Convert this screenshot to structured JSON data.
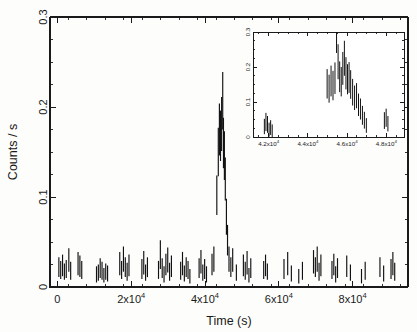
{
  "figure": {
    "kind": "x-ray-light-curve",
    "background_color": "#fdfdfc",
    "ink_color": "#111111"
  },
  "chart_data": {
    "type": "line",
    "title": "",
    "subtitle": "",
    "xlabel": "Time (s)",
    "ylabel": "Counts / s",
    "xlim": [
      -2000,
      95000
    ],
    "ylim": [
      0,
      0.3
    ],
    "grid": false,
    "legend": null,
    "legend_position": "none",
    "x_ticks": [
      0,
      20000,
      40000,
      60000,
      80000
    ],
    "x_tick_labels": [
      "0",
      "2x10",
      "4x10",
      "6x10",
      "8x10"
    ],
    "x_tick_exponents": [
      "",
      "4",
      "4",
      "4",
      "4"
    ],
    "x_minor_tick_step": 5000,
    "y_ticks": [
      0,
      0.1,
      0.2,
      0.3
    ],
    "y_tick_labels": [
      "0",
      "0.1",
      "0.2",
      "0.3"
    ],
    "y_minor_tick_step": 0.025,
    "series": [
      {
        "name": "0.2-10 keV count rate",
        "style": "errorbar-vertical",
        "points": [
          {
            "x": 400,
            "y": 0.022,
            "yerr": 0.011
          },
          {
            "x": 900,
            "y": 0.019,
            "yerr": 0.01
          },
          {
            "x": 1400,
            "y": 0.024,
            "yerr": 0.012
          },
          {
            "x": 1900,
            "y": 0.017,
            "yerr": 0.009
          },
          {
            "x": 2400,
            "y": 0.02,
            "yerr": 0.01
          },
          {
            "x": 3100,
            "y": 0.03,
            "yerr": 0.013
          },
          {
            "x": 3600,
            "y": 0.018,
            "yerr": 0.01
          },
          {
            "x": 5600,
            "y": 0.026,
            "yerr": 0.013
          },
          {
            "x": 6100,
            "y": 0.023,
            "yerr": 0.012
          },
          {
            "x": 6600,
            "y": 0.019,
            "yerr": 0.01
          },
          {
            "x": 10600,
            "y": 0.014,
            "yerr": 0.009
          },
          {
            "x": 11100,
            "y": 0.016,
            "yerr": 0.009
          },
          {
            "x": 11600,
            "y": 0.021,
            "yerr": 0.011
          },
          {
            "x": 12100,
            "y": 0.018,
            "yerr": 0.01
          },
          {
            "x": 12600,
            "y": 0.013,
            "yerr": 0.008
          },
          {
            "x": 13100,
            "y": 0.017,
            "yerr": 0.009
          },
          {
            "x": 13600,
            "y": 0.015,
            "yerr": 0.009
          },
          {
            "x": 16900,
            "y": 0.026,
            "yerr": 0.013
          },
          {
            "x": 17400,
            "y": 0.019,
            "yerr": 0.01
          },
          {
            "x": 17900,
            "y": 0.031,
            "yerr": 0.014
          },
          {
            "x": 18400,
            "y": 0.022,
            "yerr": 0.011
          },
          {
            "x": 18900,
            "y": 0.017,
            "yerr": 0.01
          },
          {
            "x": 19400,
            "y": 0.024,
            "yerr": 0.012
          },
          {
            "x": 22900,
            "y": 0.02,
            "yerr": 0.011
          },
          {
            "x": 23400,
            "y": 0.027,
            "yerr": 0.013
          },
          {
            "x": 23900,
            "y": 0.016,
            "yerr": 0.009
          },
          {
            "x": 24400,
            "y": 0.022,
            "yerr": 0.011
          },
          {
            "x": 27400,
            "y": 0.019,
            "yerr": 0.01
          },
          {
            "x": 27900,
            "y": 0.036,
            "yerr": 0.016
          },
          {
            "x": 28400,
            "y": 0.021,
            "yerr": 0.011
          },
          {
            "x": 28900,
            "y": 0.014,
            "yerr": 0.009
          },
          {
            "x": 29400,
            "y": 0.025,
            "yerr": 0.012
          },
          {
            "x": 29900,
            "y": 0.03,
            "yerr": 0.014
          },
          {
            "x": 30400,
            "y": 0.017,
            "yerr": 0.01
          },
          {
            "x": 30900,
            "y": 0.023,
            "yerr": 0.012
          },
          {
            "x": 33400,
            "y": 0.018,
            "yerr": 0.01
          },
          {
            "x": 33900,
            "y": 0.026,
            "yerr": 0.013
          },
          {
            "x": 34400,
            "y": 0.015,
            "yerr": 0.009
          },
          {
            "x": 34900,
            "y": 0.022,
            "yerr": 0.011
          },
          {
            "x": 35400,
            "y": 0.019,
            "yerr": 0.01
          },
          {
            "x": 35900,
            "y": 0.012,
            "yerr": 0.008
          },
          {
            "x": 38400,
            "y": 0.021,
            "yerr": 0.011
          },
          {
            "x": 38900,
            "y": 0.028,
            "yerr": 0.013
          },
          {
            "x": 39400,
            "y": 0.016,
            "yerr": 0.009
          },
          {
            "x": 39900,
            "y": 0.02,
            "yerr": 0.011
          },
          {
            "x": 40400,
            "y": 0.014,
            "yerr": 0.009
          },
          {
            "x": 41900,
            "y": 0.025,
            "yerr": 0.012
          },
          {
            "x": 42400,
            "y": 0.031,
            "yerr": 0.014
          },
          {
            "x": 43200,
            "y": 0.102,
            "yerr": 0.022
          },
          {
            "x": 43600,
            "y": 0.15,
            "yerr": 0.027
          },
          {
            "x": 43900,
            "y": 0.175,
            "yerr": 0.029
          },
          {
            "x": 44200,
            "y": 0.168,
            "yerr": 0.028
          },
          {
            "x": 44500,
            "y": 0.181,
            "yerr": 0.03
          },
          {
            "x": 44800,
            "y": 0.207,
            "yerr": 0.032
          },
          {
            "x": 45000,
            "y": 0.16,
            "yerr": 0.028
          },
          {
            "x": 45250,
            "y": 0.146,
            "yerr": 0.027
          },
          {
            "x": 45500,
            "y": 0.12,
            "yerr": 0.024
          },
          {
            "x": 45800,
            "y": 0.078,
            "yerr": 0.02
          },
          {
            "x": 46100,
            "y": 0.052,
            "yerr": 0.017
          },
          {
            "x": 46500,
            "y": 0.031,
            "yerr": 0.014
          },
          {
            "x": 47000,
            "y": 0.022,
            "yerr": 0.011
          },
          {
            "x": 47500,
            "y": 0.03,
            "yerr": 0.013
          },
          {
            "x": 48500,
            "y": 0.016,
            "yerr": 0.009
          },
          {
            "x": 50400,
            "y": 0.024,
            "yerr": 0.012
          },
          {
            "x": 50900,
            "y": 0.018,
            "yerr": 0.01
          },
          {
            "x": 51400,
            "y": 0.027,
            "yerr": 0.013
          },
          {
            "x": 51900,
            "y": 0.013,
            "yerr": 0.008
          },
          {
            "x": 52400,
            "y": 0.021,
            "yerr": 0.011
          },
          {
            "x": 55900,
            "y": 0.019,
            "yerr": 0.01
          },
          {
            "x": 56400,
            "y": 0.024,
            "yerr": 0.012
          },
          {
            "x": 56900,
            "y": 0.017,
            "yerr": 0.009
          },
          {
            "x": 61400,
            "y": 0.02,
            "yerr": 0.011
          },
          {
            "x": 62400,
            "y": 0.026,
            "yerr": 0.013
          },
          {
            "x": 63400,
            "y": 0.015,
            "yerr": 0.009
          },
          {
            "x": 65400,
            "y": 0.012,
            "yerr": 0.008
          },
          {
            "x": 66400,
            "y": 0.018,
            "yerr": 0.01
          },
          {
            "x": 69400,
            "y": 0.028,
            "yerr": 0.013
          },
          {
            "x": 69900,
            "y": 0.022,
            "yerr": 0.011
          },
          {
            "x": 70400,
            "y": 0.031,
            "yerr": 0.014
          },
          {
            "x": 70900,
            "y": 0.017,
            "yerr": 0.01
          },
          {
            "x": 71400,
            "y": 0.024,
            "yerr": 0.012
          },
          {
            "x": 74400,
            "y": 0.019,
            "yerr": 0.01
          },
          {
            "x": 74900,
            "y": 0.025,
            "yerr": 0.012
          },
          {
            "x": 75400,
            "y": 0.014,
            "yerr": 0.009
          },
          {
            "x": 75900,
            "y": 0.021,
            "yerr": 0.011
          },
          {
            "x": 78400,
            "y": 0.023,
            "yerr": 0.012
          },
          {
            "x": 79400,
            "y": 0.016,
            "yerr": 0.009
          },
          {
            "x": 82400,
            "y": 0.012,
            "yerr": 0.008
          },
          {
            "x": 83400,
            "y": 0.018,
            "yerr": 0.01
          },
          {
            "x": 87400,
            "y": 0.022,
            "yerr": 0.011
          },
          {
            "x": 88400,
            "y": 0.015,
            "yerr": 0.009
          },
          {
            "x": 90400,
            "y": 0.02,
            "yerr": 0.011
          },
          {
            "x": 90900,
            "y": 0.026,
            "yerr": 0.013
          },
          {
            "x": 91400,
            "y": 0.017,
            "yerr": 0.01
          }
        ]
      }
    ],
    "inset": {
      "type": "line",
      "xlabel": "",
      "ylabel": "",
      "xlim": [
        41200,
        48900
      ],
      "ylim": [
        0,
        0.3
      ],
      "grid": false,
      "x_ticks": [
        42000,
        44000,
        46000,
        48000
      ],
      "x_tick_labels": [
        "4.2x10",
        "4.4x10",
        "4.6x10",
        "4.8x10"
      ],
      "x_tick_exponents": [
        "4",
        "4",
        "4",
        "4"
      ],
      "x_minor_tick_step": 500,
      "y_ticks": [
        0,
        0.1,
        0.2,
        0.3
      ],
      "y_tick_labels": [
        "0",
        "0.1",
        "0.2",
        "0.3"
      ],
      "y_minor_tick_step": 0.025,
      "series": [
        {
          "name": "flare zoom",
          "style": "errorbar-vertical",
          "points": [
            {
              "x": 41780,
              "y": 0.03,
              "yerr": 0.022
            },
            {
              "x": 41860,
              "y": 0.043,
              "yerr": 0.026
            },
            {
              "x": 41940,
              "y": 0.036,
              "yerr": 0.024
            },
            {
              "x": 42020,
              "y": 0.021,
              "yerr": 0.02
            },
            {
              "x": 42100,
              "y": 0.027,
              "yerr": 0.021
            },
            {
              "x": 42180,
              "y": 0.018,
              "yerr": 0.018
            },
            {
              "x": 44980,
              "y": 0.152,
              "yerr": 0.042
            },
            {
              "x": 45080,
              "y": 0.138,
              "yerr": 0.04
            },
            {
              "x": 45180,
              "y": 0.16,
              "yerr": 0.044
            },
            {
              "x": 45280,
              "y": 0.147,
              "yerr": 0.042
            },
            {
              "x": 45380,
              "y": 0.168,
              "yerr": 0.045
            },
            {
              "x": 45460,
              "y": 0.3,
              "yerr": 0.06
            },
            {
              "x": 45540,
              "y": 0.215,
              "yerr": 0.05
            },
            {
              "x": 45620,
              "y": 0.172,
              "yerr": 0.044
            },
            {
              "x": 45700,
              "y": 0.158,
              "yerr": 0.042
            },
            {
              "x": 45780,
              "y": 0.196,
              "yerr": 0.047
            },
            {
              "x": 45860,
              "y": 0.225,
              "yerr": 0.05
            },
            {
              "x": 45940,
              "y": 0.182,
              "yerr": 0.046
            },
            {
              "x": 46020,
              "y": 0.165,
              "yerr": 0.043
            },
            {
              "x": 46100,
              "y": 0.17,
              "yerr": 0.044
            },
            {
              "x": 46180,
              "y": 0.15,
              "yerr": 0.041
            },
            {
              "x": 46280,
              "y": 0.128,
              "yerr": 0.038
            },
            {
              "x": 46380,
              "y": 0.112,
              "yerr": 0.035
            },
            {
              "x": 46480,
              "y": 0.118,
              "yerr": 0.036
            },
            {
              "x": 46580,
              "y": 0.092,
              "yerr": 0.032
            },
            {
              "x": 46680,
              "y": 0.08,
              "yerr": 0.03
            },
            {
              "x": 46780,
              "y": 0.062,
              "yerr": 0.027
            },
            {
              "x": 46880,
              "y": 0.048,
              "yerr": 0.024
            },
            {
              "x": 46980,
              "y": 0.033,
              "yerr": 0.021
            },
            {
              "x": 47900,
              "y": 0.047,
              "yerr": 0.024
            },
            {
              "x": 47990,
              "y": 0.055,
              "yerr": 0.026
            },
            {
              "x": 48080,
              "y": 0.038,
              "yerr": 0.022
            }
          ]
        }
      ]
    }
  }
}
